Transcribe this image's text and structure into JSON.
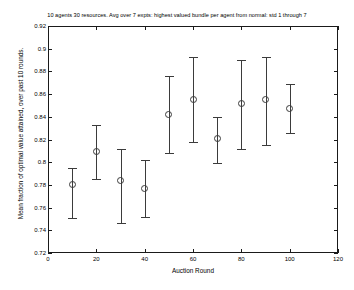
{
  "chart_data": {
    "type": "scatter",
    "title": "10 agents 30 resources. Avg over 7 expts: highest valued bundle per agent from normal: std 1 through 7",
    "xlabel": "Auction Round",
    "ylabel": "Mean fraction of optimal value attained, over past 10 rounds.",
    "xlim": [
      0,
      120
    ],
    "ylim": [
      0.72,
      0.92
    ],
    "grid": false,
    "legend": null,
    "marker": "circle-open",
    "errorbars": true,
    "xticks": [
      0,
      20,
      40,
      60,
      80,
      100,
      120
    ],
    "xtick_labels": [
      "0",
      "20",
      "40",
      "60",
      "80",
      "100",
      "120"
    ],
    "yticks": [
      0.72,
      0.74,
      0.76,
      0.78,
      0.8,
      0.82,
      0.84,
      0.86,
      0.88,
      0.9,
      0.92
    ],
    "ytick_labels": [
      "0.72",
      "0.74",
      "0.76",
      "0.78",
      "0.8",
      "0.82",
      "0.84",
      "0.86",
      "0.88",
      "0.9",
      "0.92"
    ],
    "x": [
      10,
      20,
      30,
      40,
      50,
      60,
      70,
      80,
      90,
      100
    ],
    "values": [
      0.78,
      0.809,
      0.784,
      0.777,
      0.842,
      0.855,
      0.821,
      0.852,
      0.855,
      0.847
    ],
    "yerr_low": [
      0.751,
      0.785,
      0.746,
      0.752,
      0.808,
      0.818,
      0.799,
      0.812,
      0.815,
      0.826
    ],
    "yerr_high": [
      0.795,
      0.833,
      0.812,
      0.802,
      0.876,
      0.893,
      0.84,
      0.89,
      0.893,
      0.869
    ],
    "points": [
      {
        "round": 10,
        "mean": 0.78,
        "low": 0.751,
        "high": 0.795
      },
      {
        "round": 20,
        "mean": 0.809,
        "low": 0.785,
        "high": 0.833
      },
      {
        "round": 30,
        "mean": 0.784,
        "low": 0.746,
        "high": 0.812
      },
      {
        "round": 40,
        "mean": 0.777,
        "low": 0.752,
        "high": 0.802
      },
      {
        "round": 50,
        "mean": 0.842,
        "low": 0.808,
        "high": 0.876
      },
      {
        "round": 60,
        "mean": 0.855,
        "low": 0.818,
        "high": 0.893
      },
      {
        "round": 70,
        "mean": 0.821,
        "low": 0.799,
        "high": 0.84
      },
      {
        "round": 80,
        "mean": 0.852,
        "low": 0.812,
        "high": 0.89
      },
      {
        "round": 90,
        "mean": 0.855,
        "low": 0.815,
        "high": 0.893
      },
      {
        "round": 100,
        "mean": 0.847,
        "low": 0.826,
        "high": 0.869
      }
    ]
  }
}
